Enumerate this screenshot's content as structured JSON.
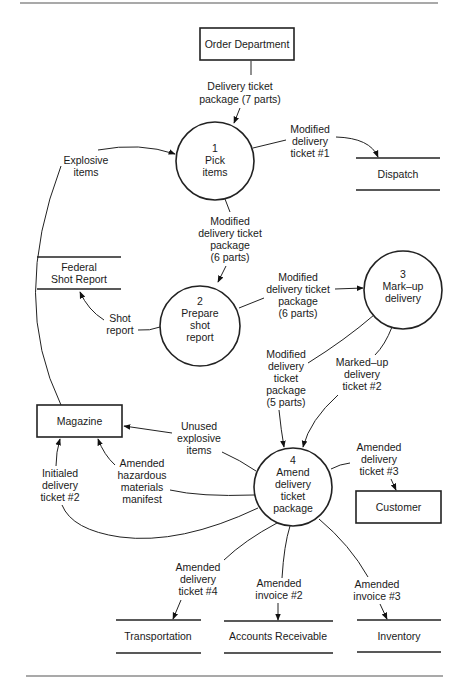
{
  "diagram": {
    "type": "data-flow-diagram",
    "external_entities": {
      "order_department": "Order Department",
      "magazine": "Magazine",
      "customer": "Customer"
    },
    "processes": [
      {
        "number": "1",
        "line1": "Pick",
        "line2": "items",
        "line3": ""
      },
      {
        "number": "2",
        "line1": "Prepare",
        "line2": "shot",
        "line3": "report"
      },
      {
        "number": "3",
        "line1": "Mark–up",
        "line2": "delivery",
        "line3": ""
      },
      {
        "number": "4",
        "line1": "Amend",
        "line2": "delivery",
        "line3": "ticket",
        "line4": "package"
      }
    ],
    "data_stores": {
      "dispatch": "Dispatch",
      "federal_shot_report_1": "Federal",
      "federal_shot_report_2": "Shot Report",
      "transportation": "Transportation",
      "accounts_receivable": "Accounts Receivable",
      "inventory": "Inventory"
    },
    "flows": {
      "order_to_p1": [
        "Delivery ticket",
        "package (7 parts)"
      ],
      "p1_to_dispatch": [
        "Modified",
        "delivery",
        "ticket #1"
      ],
      "magazine_to_p1": [
        "Explosive",
        "items"
      ],
      "p1_to_p2": [
        "Modified",
        "delivery ticket",
        "package",
        "(6 parts)"
      ],
      "p2_to_fsr": [
        "Shot",
        "report"
      ],
      "p2_to_p3": [
        "Modified",
        "delivery ticket",
        "package",
        "(6 parts)"
      ],
      "p2_to_p4": [
        "Modified",
        "delivery",
        "ticket",
        "package",
        "(5 parts)"
      ],
      "p3_to_p4": [
        "Marked–up",
        "delivery",
        "ticket #2"
      ],
      "p4_to_magazine_unused": [
        "Unused",
        "explosive",
        "items"
      ],
      "p4_to_magazine_hazmat": [
        "Amended",
        "hazardous",
        "materials",
        "manifest"
      ],
      "p4_to_magazine_initialed": [
        "Initialed",
        "delivery",
        "ticket #2"
      ],
      "p4_to_customer": [
        "Amended",
        "delivery",
        "ticket #3"
      ],
      "p4_to_transportation": [
        "Amended",
        "delivery",
        "ticket #4"
      ],
      "p4_to_accounts_receivable": [
        "Amended",
        "invoice #2"
      ],
      "p4_to_inventory": [
        "Amended",
        "invoice #3"
      ]
    }
  }
}
